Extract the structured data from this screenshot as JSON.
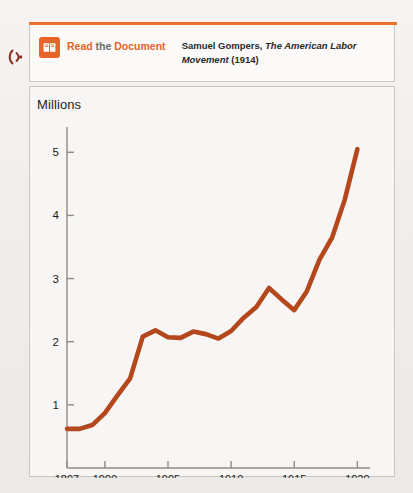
{
  "callout": {
    "icon_name": "open-book-icon",
    "audio_icon_name": "listen-audio-icon",
    "label_read": "Read",
    "label_the": "the",
    "label_document": "Document",
    "citation_author": "Samuel Gompers,",
    "citation_title": "The American Labor Movement",
    "citation_year": "(1914)",
    "accent_color": "#e8622a",
    "rule_color": "#e8722c"
  },
  "chart_data": {
    "type": "line",
    "title": "",
    "ylabel": "Millions",
    "xlabel": "",
    "line_color": "#b5471c",
    "grid": false,
    "legend": null,
    "xlim": [
      1897,
      1921
    ],
    "ylim": [
      0,
      5.4
    ],
    "ytick_labels": [
      "1",
      "2",
      "3",
      "4",
      "5"
    ],
    "yticks": [
      1,
      2,
      3,
      4,
      5
    ],
    "xtick_labels": [
      "1897",
      "1900",
      "1905",
      "1910",
      "1915",
      "1920"
    ],
    "xticks": [
      1897,
      1900,
      1905,
      1910,
      1915,
      1920
    ],
    "series": [
      {
        "name": "Union membership (millions)",
        "x": [
          1897,
          1898,
          1899,
          1900,
          1901,
          1902,
          1903,
          1904,
          1905,
          1906,
          1907,
          1908,
          1909,
          1910,
          1911,
          1912,
          1913,
          1914,
          1915,
          1916,
          1917,
          1918,
          1919,
          1920
        ],
        "values": [
          0.62,
          0.62,
          0.68,
          0.87,
          1.15,
          1.42,
          2.08,
          2.18,
          2.07,
          2.06,
          2.16,
          2.12,
          2.05,
          2.17,
          2.38,
          2.55,
          2.85,
          2.67,
          2.5,
          2.8,
          3.3,
          3.65,
          4.25,
          5.05
        ]
      }
    ]
  }
}
